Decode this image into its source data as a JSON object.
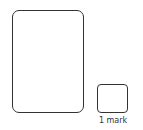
{
  "answer_area": {
    "working_box": {
      "content": ""
    },
    "answer_box": {
      "content": ""
    },
    "marks_label": "1 mark"
  }
}
